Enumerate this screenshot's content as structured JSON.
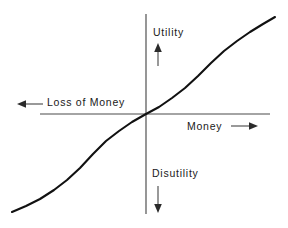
{
  "figure": {
    "background_color": "#ffffff",
    "axis_color": "#4a4a4a",
    "curve_color": "#111111",
    "arrow_color": "#2b2b2b"
  },
  "labels": {
    "utility": "Utility",
    "disutility": "Disutility",
    "money": "Money",
    "loss_of_money": "Loss of Money"
  },
  "axes": {
    "vertical": {
      "x": 146,
      "y_top": 14,
      "y_bottom": 214
    },
    "horizontal": {
      "y": 114,
      "x_left": 40,
      "x_right": 270
    }
  },
  "arrows": {
    "utility_up": {
      "x": 158,
      "y_from": 66,
      "y_to": 45,
      "direction": "up"
    },
    "disutility_down": {
      "x": 158,
      "y_from": 186,
      "y_to": 213,
      "direction": "down"
    },
    "money_right": {
      "y": 126,
      "x_from": 231,
      "x_to": 258,
      "direction": "right"
    },
    "loss_left": {
      "y": 104,
      "x_from": 43,
      "x_to": 17,
      "direction": "left"
    }
  },
  "chart_data": {
    "type": "line",
    "title": "",
    "xlabel": "Money",
    "ylabel": "Utility",
    "x_negative_label": "Loss of Money",
    "y_negative_label": "Disutility",
    "grid": false,
    "legend": null,
    "axis_style": "centered-cross-through-origin",
    "origin": {
      "x": 0,
      "y": 0
    },
    "xlim": [
      -1,
      1
    ],
    "ylim": [
      -1,
      1
    ],
    "series": [
      {
        "name": "Utility curve",
        "shape": "S-shaped (sigmoid) through origin",
        "x": [
          -1.0,
          -0.9,
          -0.8,
          -0.7,
          -0.6,
          -0.5,
          -0.4,
          -0.3,
          -0.2,
          -0.1,
          0.0,
          0.1,
          0.2,
          0.3,
          0.4,
          0.5,
          0.6,
          0.7,
          0.8,
          0.9,
          1.0
        ],
        "y": [
          -0.97,
          -0.9,
          -0.82,
          -0.74,
          -0.65,
          -0.55,
          -0.43,
          -0.3,
          -0.17,
          -0.07,
          0.0,
          0.07,
          0.17,
          0.3,
          0.43,
          0.55,
          0.65,
          0.74,
          0.82,
          0.9,
          0.97
        ]
      }
    ],
    "path_points_px": [
      [
        12,
        212
      ],
      [
        26,
        206
      ],
      [
        40,
        199
      ],
      [
        54,
        190
      ],
      [
        67,
        180
      ],
      [
        80,
        168
      ],
      [
        93,
        154
      ],
      [
        106,
        141
      ],
      [
        119,
        131
      ],
      [
        132,
        122
      ],
      [
        146,
        114
      ],
      [
        159,
        107
      ],
      [
        172,
        98
      ],
      [
        185,
        88
      ],
      [
        198,
        76
      ],
      [
        211,
        63
      ],
      [
        224,
        51
      ],
      [
        237,
        41
      ],
      [
        250,
        32
      ],
      [
        263,
        24
      ],
      [
        275,
        17
      ]
    ]
  }
}
